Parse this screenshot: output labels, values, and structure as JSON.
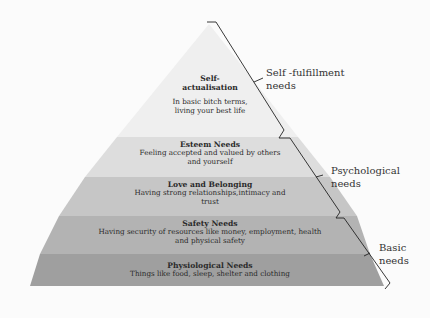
{
  "diagram": {
    "type": "pyramid",
    "levels": [
      {
        "title": "Self-actualisation",
        "title_lines": [
          "Self-",
          "actualisation"
        ],
        "description": "In basic bitch terms, living your best life",
        "desc_lines": [
          "In basic bitch terms,",
          "living your best life"
        ],
        "color": "#eeeeee"
      },
      {
        "title": "Esteem Needs",
        "description": "Feeling accepted and valued by others and yourself",
        "desc_lines": [
          "Feeling accepted and valued by others",
          "and yourself"
        ],
        "color": "#dcdcdc"
      },
      {
        "title": "Love and Belonging",
        "description": "Having strong relationships,intimacy and trust",
        "desc_lines": [
          "Having strong relationships,intimacy and",
          "trust"
        ],
        "color": "#c4c4c4"
      },
      {
        "title": "Safety Needs",
        "description": "Having security of resources like money, employment, health and physical safety",
        "desc_lines": [
          "Having security of resources like money, employment, health",
          "and physical safety"
        ],
        "color": "#b0b0b0"
      },
      {
        "title": "Physiological Needs",
        "description": "Things like food, sleep, shelter and clothing",
        "desc_lines": [
          "Things like food, sleep, shelter and clothing"
        ],
        "color": "#9c9c9c"
      }
    ],
    "groups": [
      {
        "label": "Self -fulfillment needs",
        "label_lines": [
          "Self -fulfillment",
          "needs"
        ],
        "spans": [
          "Self-actualisation"
        ]
      },
      {
        "label": "Psychological needs",
        "label_lines": [
          "Psychological",
          "needs"
        ],
        "spans": [
          "Esteem Needs",
          "Love and Belonging"
        ]
      },
      {
        "label": "Basic needs",
        "label_lines": [
          "Basic",
          "needs"
        ],
        "spans": [
          "Safety Needs",
          "Physiological Needs"
        ]
      }
    ]
  }
}
